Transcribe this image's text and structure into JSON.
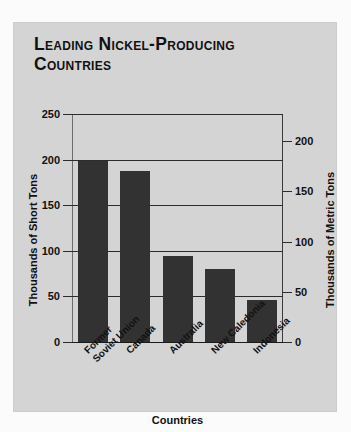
{
  "title": "Leading Nickel-Producing Countries",
  "chart_data": {
    "type": "bar",
    "title": "Leading Nickel-Producing Countries",
    "categories": [
      "Former Soviet Union",
      "Canada",
      "Australia",
      "New Caledonia",
      "Indonesia"
    ],
    "category_lines": [
      [
        "Former",
        "Soviet Union"
      ],
      [
        "Canada"
      ],
      [
        "Australia"
      ],
      [
        "New Caledonia"
      ],
      [
        "Indonesia"
      ]
    ],
    "values": [
      199,
      188,
      94,
      80,
      46
    ],
    "xlabel": "Countries",
    "ylabel": "Thousands of Short Tons",
    "ylabel_right": "Thousands of Metric Tons",
    "ylim": [
      0,
      250
    ],
    "yticks": [
      0,
      50,
      100,
      150,
      200,
      250
    ],
    "ylim_right": [
      0,
      227
    ],
    "yticks_right": [
      0,
      50,
      100,
      150,
      200
    ],
    "grid": true,
    "legend": null,
    "bar_color": "#323232",
    "background_color": "#d4d4d4"
  }
}
